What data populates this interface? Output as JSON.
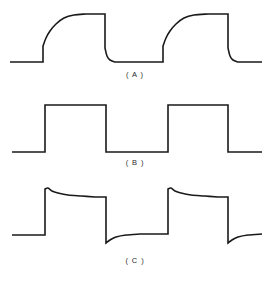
{
  "figure": {
    "background_color": "#ffffff",
    "line_color": "#1a1a1a",
    "line_width_px": 1.6,
    "width_px": 270,
    "height_px": 289,
    "panel_count": 3
  },
  "panels": [
    {
      "id": "A",
      "label": "( A )",
      "label_text": "(A)",
      "description": "Integrated square wave: exponential (rounded) rising edge, flat top, sharp falling edge with slightly rounded bottom corner",
      "waveform_type": "integrated-square-wave",
      "baseline_y": 62,
      "top_y": 14,
      "cycles": 2,
      "edges": {
        "rise_1_x": 43,
        "fall_1_x": 105,
        "rise_2_x": 163,
        "fall_2_x": 228
      }
    },
    {
      "id": "B",
      "label": "( B )",
      "label_text": "(B)",
      "description": "Ideal square wave: sharp vertical rising and falling edges, flat top and flat bottom",
      "waveform_type": "square-wave",
      "baseline_y": 57,
      "top_y": 10,
      "cycles": 2,
      "edges": {
        "rise_1_x": 45,
        "fall_1_x": 106,
        "rise_2_x": 168,
        "fall_2_x": 228
      }
    },
    {
      "id": "C",
      "label": "( C )",
      "label_text": "(C)",
      "description": "Differentiated square wave: overshoot spike on rising edge decaying exponentially (droop), undershoot below baseline on falling edge recovering exponentially",
      "waveform_type": "differentiated-square-wave",
      "baseline_y": 52,
      "top_y": 6,
      "overshoot_peak_y": 5,
      "droop_level_y": 14,
      "undershoot_y": 60,
      "cycles": 2,
      "edges": {
        "rise_1_x": 45,
        "fall_1_x": 106,
        "rise_2_x": 168,
        "fall_2_x": 228
      }
    }
  ],
  "chart_data": {
    "type": "line",
    "title": "",
    "xlabel": "",
    "ylabel": "",
    "grid": false,
    "legend": "none",
    "subplots": [
      {
        "name": "(A)",
        "series_name": "integrated square wave",
        "xlim": [
          0,
          270
        ],
        "ylim": [
          0,
          72
        ],
        "points": [
          [
            10,
            62
          ],
          [
            43,
            62
          ],
          [
            43,
            46
          ],
          [
            46,
            38
          ],
          [
            50,
            31
          ],
          [
            56,
            24
          ],
          [
            64,
            18
          ],
          [
            74,
            15
          ],
          [
            86,
            14
          ],
          [
            103,
            14
          ],
          [
            105,
            14
          ],
          [
            105,
            48
          ],
          [
            107,
            56
          ],
          [
            110,
            60
          ],
          [
            115,
            62
          ],
          [
            160,
            62
          ],
          [
            163,
            62
          ],
          [
            163,
            46
          ],
          [
            166,
            38
          ],
          [
            170,
            31
          ],
          [
            176,
            24
          ],
          [
            184,
            18
          ],
          [
            194,
            15
          ],
          [
            208,
            14
          ],
          [
            226,
            14
          ],
          [
            228,
            14
          ],
          [
            228,
            48
          ],
          [
            230,
            56
          ],
          [
            233,
            60
          ],
          [
            238,
            62
          ],
          [
            262,
            62
          ]
        ]
      },
      {
        "name": "(B)",
        "series_name": "ideal square wave",
        "xlim": [
          0,
          270
        ],
        "ylim": [
          0,
          62
        ],
        "points": [
          [
            12,
            57
          ],
          [
            45,
            57
          ],
          [
            45,
            10
          ],
          [
            106,
            10
          ],
          [
            106,
            57
          ],
          [
            168,
            57
          ],
          [
            168,
            10
          ],
          [
            228,
            10
          ],
          [
            228,
            57
          ],
          [
            262,
            57
          ]
        ]
      },
      {
        "name": "(C)",
        "series_name": "differentiated square wave",
        "xlim": [
          0,
          270
        ],
        "ylim": [
          0,
          70
        ],
        "points": [
          [
            12,
            52
          ],
          [
            45,
            52
          ],
          [
            45,
            6
          ],
          [
            48,
            5
          ],
          [
            52,
            8
          ],
          [
            58,
            10
          ],
          [
            68,
            12
          ],
          [
            82,
            13
          ],
          [
            95,
            14
          ],
          [
            106,
            14
          ],
          [
            106,
            60
          ],
          [
            110,
            57
          ],
          [
            116,
            54
          ],
          [
            126,
            52
          ],
          [
            140,
            51
          ],
          [
            155,
            51
          ],
          [
            168,
            51
          ],
          [
            168,
            6
          ],
          [
            171,
            5
          ],
          [
            175,
            8
          ],
          [
            181,
            10
          ],
          [
            191,
            12
          ],
          [
            205,
            13
          ],
          [
            218,
            14
          ],
          [
            228,
            14
          ],
          [
            228,
            60
          ],
          [
            232,
            57
          ],
          [
            238,
            54
          ],
          [
            248,
            52
          ],
          [
            262,
            51
          ]
        ]
      }
    ]
  }
}
